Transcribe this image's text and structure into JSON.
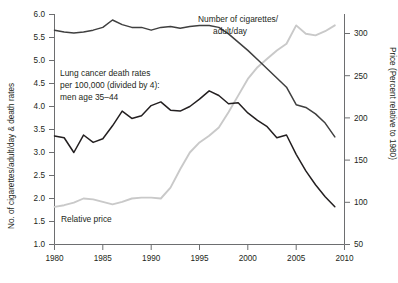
{
  "chart_data": {
    "type": "line",
    "title": "",
    "xlabel": "",
    "ylabel": "No. of cigarettes/adult/day & death rates",
    "ylabel_right": "Price (Percent relative to 1980)",
    "xlim": [
      1980,
      2010
    ],
    "ylim": [
      1.0,
      6.0
    ],
    "ylim_right": [
      50,
      325
    ],
    "xticks": [
      1980,
      1985,
      1990,
      1995,
      2000,
      2005,
      2010
    ],
    "xtick_labels": [
      "1980",
      "1985",
      "1990",
      "1995",
      "2000",
      "2005",
      "2010"
    ],
    "yticks": [
      1.0,
      1.5,
      2.0,
      2.5,
      3.0,
      3.5,
      4.0,
      4.5,
      5.0,
      5.5,
      6.0
    ],
    "ytick_labels": [
      "1.0",
      "1.5",
      "2.0",
      "2.5",
      "3.0",
      "3.5",
      "4.0",
      "4.5",
      "5.0",
      "5.5",
      "6.0"
    ],
    "yticks_right": [
      50,
      100,
      150,
      200,
      250,
      300
    ],
    "ytick_labels_right": [
      "50",
      "100",
      "150",
      "200",
      "250",
      "300"
    ],
    "grid": false,
    "legend_position": "inline-annotations",
    "series": [
      {
        "name": "Number of cigarettes/adult/day",
        "axis": "left",
        "color": "#3f3f3f",
        "x": [
          1980,
          1981,
          1982,
          1983,
          1984,
          1985,
          1986,
          1987,
          1988,
          1989,
          1990,
          1991,
          1992,
          1993,
          1994,
          1995,
          1996,
          1997,
          1998,
          1999,
          2000,
          2001,
          2002,
          2003,
          2004,
          2005,
          2006,
          2007,
          2008,
          2009
        ],
        "values": [
          5.66,
          5.62,
          5.6,
          5.62,
          5.66,
          5.72,
          5.88,
          5.78,
          5.72,
          5.72,
          5.66,
          5.72,
          5.74,
          5.7,
          5.74,
          5.76,
          5.76,
          5.72,
          5.58,
          5.4,
          5.22,
          5.02,
          4.82,
          4.62,
          4.42,
          4.04,
          3.98,
          3.84,
          3.64,
          3.34
        ]
      },
      {
        "name": "Lung cancer death rates per 100,000 (divided by 4): men age 35-44",
        "axis": "left",
        "color": "#231f20",
        "x": [
          1980,
          1981,
          1982,
          1983,
          1984,
          1985,
          1986,
          1987,
          1988,
          1989,
          1990,
          1991,
          1992,
          1993,
          1994,
          1995,
          1996,
          1997,
          1998,
          1999,
          2000,
          2001,
          2002,
          2003,
          2004,
          2005,
          2006,
          2007,
          2008,
          2009
        ],
        "values": [
          3.36,
          3.32,
          3.0,
          3.38,
          3.22,
          3.3,
          3.58,
          3.9,
          3.74,
          3.8,
          4.02,
          4.1,
          3.92,
          3.9,
          4.0,
          4.16,
          4.34,
          4.24,
          4.06,
          4.08,
          3.86,
          3.7,
          3.56,
          3.32,
          3.38,
          2.96,
          2.6,
          2.3,
          2.04,
          1.82
        ]
      },
      {
        "name": "Relative price",
        "axis": "right",
        "color": "#c9c9c9",
        "x": [
          1980,
          1981,
          1982,
          1983,
          1984,
          1985,
          1986,
          1987,
          1988,
          1989,
          1990,
          1991,
          1992,
          1993,
          1994,
          1995,
          1996,
          1997,
          1998,
          1999,
          2000,
          2001,
          2002,
          2003,
          2004,
          2005,
          2006,
          2007,
          2008,
          2009
        ],
        "values": [
          95,
          97,
          100,
          105,
          104,
          101,
          98,
          101,
          105,
          106,
          106,
          105,
          118,
          140,
          160,
          172,
          180,
          190,
          208,
          228,
          248,
          262,
          272,
          282,
          290,
          312,
          302,
          300,
          305,
          312
        ]
      }
    ],
    "annotations": [
      {
        "name": "cigarettes-label",
        "text_line1": "Number of cigarettes/",
        "text_line2": "adult/day"
      },
      {
        "name": "lung-cancer-label",
        "text_line1": "Lung cancer death rates",
        "text_line2": "per 100,000 (divided by 4):",
        "text_line3": "men age 35–44"
      },
      {
        "name": "relative-price-label",
        "text_line1": "Relative price"
      }
    ]
  },
  "axes": {
    "left_title": "No. of cigarettes/adult/day & death rates",
    "right_title": "Price (Percent relative to 1980)"
  },
  "colors": {
    "cigarettes": "#3f3f3f",
    "lung_cancer": "#231f20",
    "relative_price": "#c9c9c9",
    "axis": "#6d6e70",
    "text": "#231f20"
  }
}
